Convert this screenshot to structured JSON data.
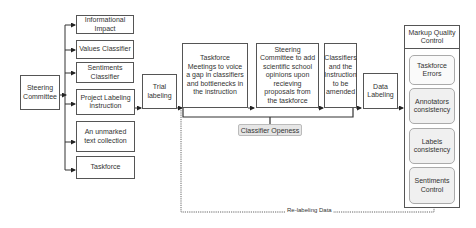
{
  "diagram": {
    "root": {
      "label": "Steering Committee"
    },
    "branches": [
      {
        "label": "Informational Impact"
      },
      {
        "label": "Values Classifier"
      },
      {
        "label": "Sentiments Classifier"
      },
      {
        "label": "Project Labeling instruction"
      },
      {
        "label": "An unmarked text collection"
      },
      {
        "label": "Taskforce"
      }
    ],
    "process": [
      {
        "label": "Trial labeling"
      },
      {
        "label": "Taskforce Meetings to voice a gap in classifiers and bottlenecks in the instruction"
      },
      {
        "label": "Steering Committee to add scientific school opinions upon recieving proposals from the taskforce"
      },
      {
        "label": "Classifiers and the Instruction to be amended"
      },
      {
        "label": "Data Labeling"
      }
    ],
    "feedback_label": "Classifier Openess",
    "quality_control": {
      "title": "Markup Quality Control",
      "items": [
        {
          "label": "Taskforce Errors"
        },
        {
          "label": "Annotators consistency"
        },
        {
          "label": "Labels consistency"
        },
        {
          "label": "Sentiments Control"
        }
      ]
    },
    "relabel_label": "Re-labeling Data"
  }
}
